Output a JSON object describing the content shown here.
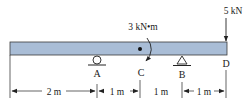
{
  "diagram": {
    "type": "beam-free-body",
    "beam_color": "#a9bdd6",
    "outline_color": "#333333",
    "points": [
      {
        "id": "A",
        "label": "A",
        "support": "roller"
      },
      {
        "id": "C",
        "label": "C",
        "support": "none"
      },
      {
        "id": "B",
        "label": "B",
        "support": "pin"
      },
      {
        "id": "D",
        "label": "D",
        "support": "free-end"
      }
    ],
    "loads": {
      "moment": {
        "label": "3 kN•m",
        "at": "C",
        "direction": "clockwise"
      },
      "force": {
        "label": "5 kN",
        "at": "D",
        "direction": "down"
      }
    },
    "dimensions": [
      {
        "label": "2 m",
        "from": "left-end",
        "to": "A"
      },
      {
        "label": "1 m",
        "from": "A",
        "to": "C"
      },
      {
        "label": "1 m",
        "from": "C",
        "to": "B"
      },
      {
        "label": "1 m",
        "from": "B",
        "to": "D"
      }
    ]
  }
}
